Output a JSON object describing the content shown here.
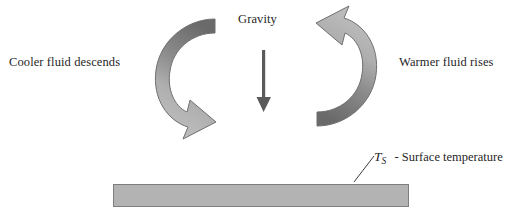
{
  "diagram": {
    "title_visible": false,
    "background_color": "#ffffff",
    "labels": {
      "cooler": "Cooler fluid descends",
      "warmer": "Warmer fluid rises",
      "gravity": "Gravity"
    },
    "annotation": {
      "symbol": "T",
      "subscript": "S",
      "description": "- Surface temperature"
    },
    "colors": {
      "arrow_dark": "#6e6e6e",
      "arrow_light": "#b9b9b9",
      "arrow_outline": "#6f6f6f",
      "gravity_arrow": "#5a5a5a",
      "plate_fill": "#b3b3b3",
      "plate_stroke": "#7e7e7e",
      "text": "#1f1f1f"
    },
    "elements": {
      "left_arrow_name": "counterclockwise-descending-flow-arrow",
      "right_arrow_name": "clockwise-rising-flow-arrow",
      "gravity_arrow_name": "gravity-down-arrow",
      "plate_name": "heated-surface-plate",
      "leader_line_name": "surface-temperature-leader-line"
    }
  }
}
